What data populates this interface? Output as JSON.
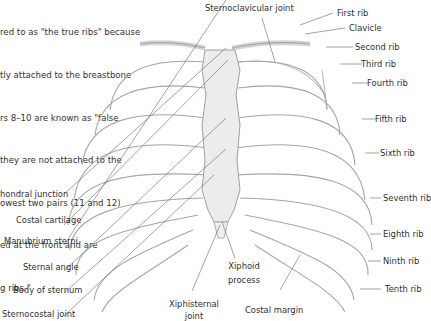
{
  "intro_text": {
    "lines": [
      "red to as \"the true ribs\" because",
      "tly attached to the breastbone",
      "rs 8–10 are known as \"false",
      "they are not attached to the",
      "owest two pairs (11 and 12)",
      "ed at the front and are",
      "g ribs.\""
    ]
  },
  "labels": {
    "top": {
      "sternoclavicular_joint": "Sternoclavicular joint"
    },
    "right": {
      "first_rib": "First rib",
      "clavicle": "Clavicle",
      "second_rib": "Second rib",
      "third_rib": "Third rib",
      "fourth_rib": "Fourth rib",
      "fifth_rib": "Fifth rib",
      "sixth_rib": "Sixth rib",
      "seventh_rib": "Seventh rib",
      "eighth_rib": "Eighth rib",
      "ninth_rib": "Ninth rib",
      "tenth_rib": "Tenth rib"
    },
    "left": {
      "costochondral_junction": "hondral junction",
      "costal_cartilage": "Costal cartilage",
      "manubrium_sterni": "Manubrium sterni",
      "sternal_angle": "Sternal angle",
      "body_of_sternum": "Body of sternum",
      "sternocostal_joint": "Sternocostal joint"
    },
    "bottom": {
      "xiphoid_process_1": "Xiphoid",
      "xiphoid_process_2": "process",
      "xiphisternal_joint_1": "Xiphisternal",
      "xiphisternal_joint_2": "joint",
      "costal_margin": "Costal margin"
    }
  },
  "colors": {
    "background": "#ffffff",
    "text": "#2f2f2f",
    "bone_stroke": "#9a9a9a",
    "bone_fill": "#f1f1f1",
    "leader_line": "#555555"
  }
}
